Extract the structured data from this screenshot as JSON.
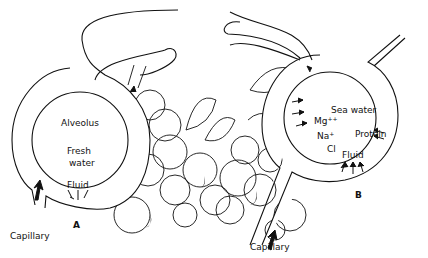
{
  "figure": {
    "panel_a": {
      "letter": "A",
      "alveolus_label": "Alveolus",
      "content_line1": "Fresh",
      "content_line2": "water",
      "fluid_label": "Fluid",
      "capillary_label": "Capillary"
    },
    "panel_b": {
      "letter": "B",
      "content_label": "Sea water",
      "ion_mg": "Mg",
      "ion_mg_charge": "++",
      "ion_na": "Na",
      "ion_na_charge": "+",
      "ion_cl": "Cl",
      "protein_label": "Protein",
      "fluid_label": "Fluid",
      "capillary_label": "Capillary"
    }
  }
}
